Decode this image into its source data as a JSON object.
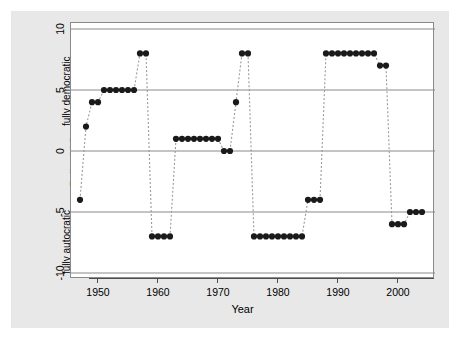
{
  "chart_data": {
    "type": "scatter",
    "title": "",
    "xlabel": "Year",
    "ylabel": "Polity IV Score",
    "xlim": [
      1946,
      2006
    ],
    "ylim": [
      -10,
      10
    ],
    "grid": "horizontal gridlines at -10, -5, 0, 5, 10",
    "legend": "none",
    "line_style": "dashed connecting line, gray",
    "marker": "filled black circle",
    "xticks": [
      1950,
      1960,
      1970,
      1980,
      1990,
      2000
    ],
    "xtick_labels": [
      "1950",
      "1960",
      "1970",
      "1980",
      "1990",
      "2000"
    ],
    "yticks": [
      10,
      5,
      0,
      -5,
      -10
    ],
    "ytick_labels": [
      "10",
      "5",
      "0",
      "-5",
      "-10"
    ],
    "annotations": [
      {
        "text": "fully democratic",
        "position": "y-axis top, rotated"
      },
      {
        "text": "fully autocratic",
        "position": "y-axis bottom, rotated"
      }
    ],
    "x": [
      1947,
      1948,
      1949,
      1950,
      1951,
      1952,
      1953,
      1954,
      1955,
      1956,
      1957,
      1958,
      1959,
      1960,
      1961,
      1962,
      1963,
      1964,
      1965,
      1966,
      1967,
      1968,
      1969,
      1970,
      1971,
      1972,
      1973,
      1974,
      1975,
      1976,
      1977,
      1978,
      1979,
      1980,
      1981,
      1982,
      1983,
      1984,
      1985,
      1986,
      1987,
      1988,
      1989,
      1990,
      1991,
      1992,
      1993,
      1994,
      1995,
      1996,
      1997,
      1998,
      1999,
      2000,
      2001,
      2002,
      2003,
      2004
    ],
    "y": [
      -4,
      2,
      4,
      4,
      5,
      5,
      5,
      5,
      5,
      5,
      8,
      8,
      -7,
      -7,
      -7,
      -7,
      1,
      1,
      1,
      1,
      1,
      1,
      1,
      1,
      0,
      0,
      4,
      8,
      8,
      -7,
      -7,
      -7,
      -7,
      -7,
      -7,
      -7,
      -7,
      -7,
      -4,
      -4,
      -4,
      8,
      8,
      8,
      8,
      8,
      8,
      8,
      8,
      8,
      7,
      7,
      -6,
      -6,
      -6,
      -5,
      -5,
      -5
    ]
  },
  "ylabel_parts": {
    "axis_title": "Polity IV Score",
    "top_note": "fully democratic",
    "bottom_note": "fully autocratic"
  },
  "colors": {
    "figure_background": "#e8e8e8",
    "panel_background": "#ffffff",
    "gridline": "#8a8a8a",
    "marker": "#1a1a1a",
    "dashed_line": "#9a9a9a",
    "axis": "#4d4d4d",
    "text": "#000000"
  }
}
